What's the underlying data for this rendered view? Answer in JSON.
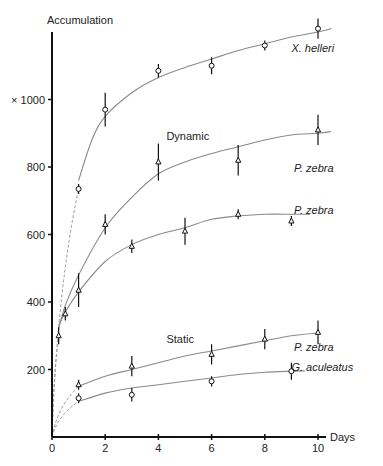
{
  "chart_data": {
    "type": "line",
    "title": "",
    "ylabel": "Accumulation",
    "ylabel_prefix": "× 1000",
    "xlabel": "Days",
    "xlim": [
      0,
      10
    ],
    "ylim": [
      0,
      1200
    ],
    "x_ticks": [
      0,
      2,
      4,
      6,
      8,
      10
    ],
    "y_ticks": [
      200,
      400,
      600,
      800,
      1000
    ],
    "y_tick_labels": [
      "200",
      "400",
      "600",
      "800",
      "× 1000"
    ],
    "grid": false,
    "annotations": [
      {
        "text": "Dynamic",
        "x": 4.3,
        "y": 880
      },
      {
        "text": "Static",
        "x": 4.3,
        "y": 280
      }
    ],
    "series": [
      {
        "name": "X. helleri",
        "group": "Dynamic",
        "marker": "open-circle",
        "points": [
          [
            1,
            735
          ],
          [
            2,
            970
          ],
          [
            4,
            1085
          ],
          [
            6,
            1100
          ],
          [
            8,
            1160
          ],
          [
            10,
            1210
          ]
        ],
        "errors": [
          15,
          50,
          20,
          25,
          15,
          30
        ],
        "curve": [
          [
            1,
            760
          ],
          [
            1.5,
            880
          ],
          [
            2,
            950
          ],
          [
            3,
            1020
          ],
          [
            4,
            1065
          ],
          [
            5,
            1095
          ],
          [
            6,
            1120
          ],
          [
            7,
            1145
          ],
          [
            8,
            1165
          ],
          [
            9,
            1185
          ],
          [
            10,
            1200
          ],
          [
            10.5,
            1210
          ]
        ]
      },
      {
        "name": "P. zebra",
        "group": "Dynamic",
        "marker": "triangle",
        "points": [
          [
            0.5,
            365
          ],
          [
            2,
            630
          ],
          [
            4,
            815
          ],
          [
            7,
            820
          ],
          [
            10,
            910
          ]
        ],
        "errors": [
          20,
          30,
          55,
          45,
          45
        ],
        "curve": [
          [
            0.25,
            320
          ],
          [
            0.5,
            390
          ],
          [
            1,
            480
          ],
          [
            2,
            620
          ],
          [
            3,
            710
          ],
          [
            4,
            780
          ],
          [
            5,
            815
          ],
          [
            6,
            840
          ],
          [
            7,
            860
          ],
          [
            8,
            880
          ],
          [
            9,
            895
          ],
          [
            10,
            900
          ],
          [
            10.5,
            905
          ]
        ]
      },
      {
        "name": "P. zebra",
        "group": "Dynamic",
        "marker": "triangle",
        "points": [
          [
            0.25,
            300
          ],
          [
            1,
            435
          ],
          [
            3,
            565
          ],
          [
            5,
            610
          ],
          [
            7,
            660
          ],
          [
            9,
            640
          ]
        ],
        "errors": [
          25,
          50,
          20,
          40,
          15,
          15
        ],
        "curve": [
          [
            0.25,
            330
          ],
          [
            0.5,
            370
          ],
          [
            1,
            430
          ],
          [
            2,
            520
          ],
          [
            3,
            570
          ],
          [
            4,
            600
          ],
          [
            5,
            620
          ],
          [
            6,
            645
          ],
          [
            7,
            655
          ],
          [
            8,
            660
          ],
          [
            9,
            660
          ],
          [
            9.7,
            660
          ]
        ]
      },
      {
        "name": "P. zebra",
        "group": "Static",
        "marker": "triangle",
        "points": [
          [
            1,
            155
          ],
          [
            3,
            210
          ],
          [
            6,
            245
          ],
          [
            8,
            290
          ],
          [
            10,
            310
          ]
        ],
        "errors": [
          15,
          30,
          30,
          30,
          35
        ],
        "curve": [
          [
            1,
            150
          ],
          [
            2,
            180
          ],
          [
            3,
            200
          ],
          [
            4,
            220
          ],
          [
            5,
            240
          ],
          [
            6,
            255
          ],
          [
            7,
            270
          ],
          [
            8,
            285
          ],
          [
            9,
            300
          ],
          [
            10,
            308
          ]
        ]
      },
      {
        "name": "G. aculeatus",
        "group": "Static",
        "marker": "open-circle",
        "points": [
          [
            1,
            115
          ],
          [
            3,
            125
          ],
          [
            6,
            165
          ],
          [
            9,
            195
          ]
        ],
        "errors": [
          15,
          20,
          15,
          25
        ],
        "curve": [
          [
            1,
            105
          ],
          [
            2,
            130
          ],
          [
            3,
            145
          ],
          [
            4,
            155
          ],
          [
            5,
            165
          ],
          [
            6,
            175
          ],
          [
            7,
            185
          ],
          [
            8,
            192
          ],
          [
            9,
            195
          ],
          [
            9.5,
            196
          ]
        ]
      }
    ],
    "dashed_extrapolations": [
      {
        "from": [
          0,
          0
        ],
        "to": [
          1,
          735
        ]
      },
      {
        "from": [
          0,
          0
        ],
        "to": [
          0.25,
          300
        ]
      },
      {
        "from": [
          0,
          0
        ],
        "to": [
          1,
          150
        ]
      },
      {
        "from": [
          0,
          0
        ],
        "to": [
          1,
          105
        ]
      }
    ],
    "series_labels": [
      {
        "text": "X. helleri",
        "x": 9.0,
        "y": 1140
      },
      {
        "text": "P. zebra",
        "x": 9.1,
        "y": 785
      },
      {
        "text": "P. zebra",
        "x": 9.1,
        "y": 660
      },
      {
        "text": "P. zebra",
        "x": 9.1,
        "y": 255
      },
      {
        "text": "G. aculeatus",
        "x": 9.0,
        "y": 195
      }
    ]
  }
}
